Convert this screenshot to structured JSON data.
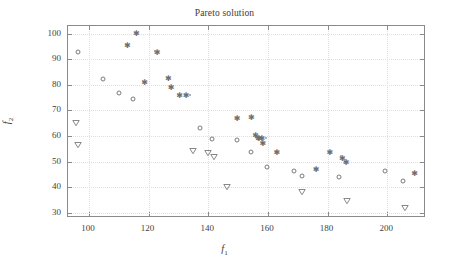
{
  "chart_data": {
    "type": "scatter",
    "title": "Pareto solution",
    "xlabel": "f_1",
    "ylabel": "f_2",
    "xlabel_base": "f",
    "xlabel_sub": "1",
    "ylabel_base": "f",
    "ylabel_sub": "2",
    "xlim": [
      93,
      213
    ],
    "ylim": [
      28,
      103
    ],
    "xticks": [
      100,
      120,
      140,
      160,
      180,
      200
    ],
    "yticks": [
      30,
      40,
      50,
      60,
      70,
      80,
      90,
      100
    ],
    "xtick_labels": [
      "100",
      "120",
      "140",
      "160",
      "180",
      "200"
    ],
    "ytick_labels": [
      "30",
      "40",
      "50",
      "60",
      "70",
      "80",
      "90",
      "100"
    ],
    "grid": true,
    "legend": null,
    "marker_color": "#7b7b7b",
    "frame_color": "#8a8a8a",
    "grid_color": "#dedede",
    "series": [
      {
        "name": "circle-series",
        "marker": "circle",
        "points": [
          [
            96.5,
            92.7
          ],
          [
            104.6,
            82.2
          ],
          [
            110.2,
            76.9
          ],
          [
            114.8,
            74.3
          ],
          [
            137.4,
            63.0
          ],
          [
            141.2,
            58.8
          ],
          [
            149.8,
            58.5
          ],
          [
            154.5,
            53.9
          ],
          [
            156.6,
            59.2
          ],
          [
            159.8,
            48.1
          ],
          [
            168.6,
            46.2
          ],
          [
            171.3,
            44.5
          ],
          [
            184.0,
            44.2
          ],
          [
            199.4,
            46.3
          ],
          [
            205.2,
            42.6
          ]
        ]
      },
      {
        "name": "star-series",
        "marker": "star",
        "points": [
          [
            112.9,
            95.6
          ],
          [
            115.9,
            100.1
          ],
          [
            118.7,
            81.2
          ],
          [
            122.9,
            92.8
          ],
          [
            126.6,
            82.5
          ],
          [
            127.6,
            79.0
          ],
          [
            130.4,
            76.2
          ],
          [
            132.6,
            76.2
          ],
          [
            149.7,
            67.2
          ],
          [
            154.5,
            67.6
          ],
          [
            155.9,
            60.6
          ],
          [
            157.0,
            59.3
          ],
          [
            158.0,
            59.1
          ],
          [
            158.3,
            57.3
          ],
          [
            163.0,
            53.9
          ],
          [
            176.2,
            47.3
          ],
          [
            180.8,
            53.8
          ],
          [
            185.0,
            51.5
          ],
          [
            186.2,
            49.8
          ],
          [
            209.2,
            45.6
          ]
        ]
      },
      {
        "name": "triangle-series",
        "marker": "triangle-down",
        "points": [
          [
            95.8,
            67.9
          ],
          [
            96.3,
            59.4
          ],
          [
            134.9,
            57.0
          ],
          [
            140.0,
            56.0
          ],
          [
            141.8,
            54.4
          ],
          [
            146.2,
            42.7
          ],
          [
            171.6,
            40.9
          ],
          [
            186.5,
            37.3
          ],
          [
            205.8,
            34.6
          ]
        ]
      },
      {
        "name": "faint-dot-series",
        "marker": "dot",
        "points": [
          [
            122.2,
            93.1
          ],
          [
            134.0,
            76.1
          ],
          [
            153.9,
            67.7
          ],
          [
            156.4,
            61.0
          ],
          [
            159.5,
            59.4
          ],
          [
            184.6,
            52.2
          ],
          [
            186.0,
            50.5
          ]
        ]
      }
    ]
  },
  "axes": {
    "title_text": "Pareto solution"
  }
}
